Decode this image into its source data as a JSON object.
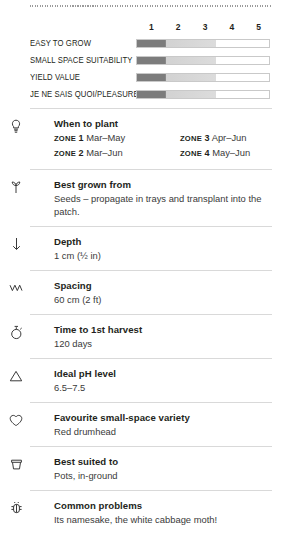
{
  "ratings": {
    "scale": [
      "1",
      "2",
      "3",
      "4",
      "5"
    ],
    "rows": [
      {
        "label": "EASY TO GROW",
        "value": 3
      },
      {
        "label": "SMALL SPACE SUITABILITY",
        "value": 3
      },
      {
        "label": "YIELD VALUE",
        "value": 3
      },
      {
        "label": "JE NE SAIS QUOI/PLEASURE",
        "value": 3
      }
    ]
  },
  "sections": [
    {
      "icon": "bulb-icon",
      "title": "When to plant",
      "zones": [
        {
          "tag": "ZONE",
          "num": "1",
          "text": "Mar–May"
        },
        {
          "tag": "ZONE",
          "num": "3",
          "text": "Apr–Jun"
        },
        {
          "tag": "ZONE",
          "num": "2",
          "text": "Mar–Jun"
        },
        {
          "tag": "ZONE",
          "num": "4",
          "text": "May–Jun"
        }
      ]
    },
    {
      "icon": "seedling-icon",
      "title": "Best grown from",
      "body": "Seeds – propagate in trays and transplant into the patch."
    },
    {
      "icon": "down-arrow-icon",
      "title": "Depth",
      "body": "1 cm (½ in)"
    },
    {
      "icon": "zigzag-icon",
      "title": "Spacing",
      "body": "60 cm (2 ft)"
    },
    {
      "icon": "stopwatch-icon",
      "title": "Time to 1st harvest",
      "body": "120 days"
    },
    {
      "icon": "triangle-icon",
      "title": "Ideal pH level",
      "body": "6.5–7.5"
    },
    {
      "icon": "heart-icon",
      "title": "Favourite small-space variety",
      "body": "Red drumhead"
    },
    {
      "icon": "pot-icon",
      "title": "Best suited to",
      "body": "Pots, in-ground"
    },
    {
      "icon": "bug-icon",
      "title": "Common problems",
      "body": "Its namesake, the white cabbage moth!"
    }
  ],
  "colors": {
    "ink": "#231f20",
    "body": "#3a3a3a",
    "bar_dark": "#7c7c7c",
    "bar_light": "#dcdcdc",
    "rule": "#d9d9d9"
  }
}
